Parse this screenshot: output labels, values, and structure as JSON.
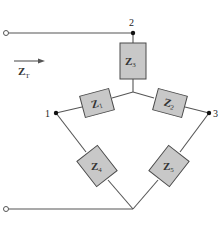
{
  "diagram": {
    "type": "circuit",
    "colors": {
      "wire": "#555555",
      "box_fill": "#c8c8c8",
      "box_stroke": "#4a4a4a",
      "node": "#111111"
    },
    "input": {
      "label_main": "Z",
      "label_sub": "T",
      "arrow_direction": "right"
    },
    "nodes": [
      {
        "id": "1",
        "label": "1"
      },
      {
        "id": "2",
        "label": "2"
      },
      {
        "id": "3",
        "label": "3"
      }
    ],
    "impedances": [
      {
        "id": "Z3",
        "main": "Z",
        "sub": "3",
        "between": "node 2 - star center"
      },
      {
        "id": "Z1",
        "main": "Z",
        "sub": "1",
        "between": "node 1 - star center"
      },
      {
        "id": "Z2",
        "main": "Z",
        "sub": "2",
        "between": "star center - node 3"
      },
      {
        "id": "Z4",
        "main": "Z",
        "sub": "4",
        "between": "node 1 - bottom"
      },
      {
        "id": "Z5",
        "main": "Z",
        "sub": "5",
        "between": "node 3 - bottom"
      }
    ]
  }
}
